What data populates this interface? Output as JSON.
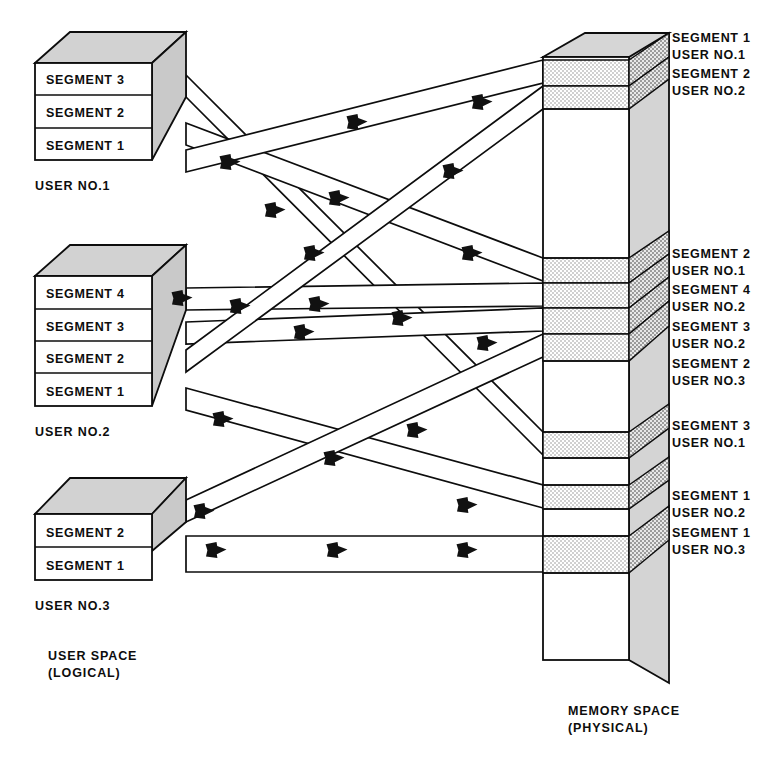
{
  "diagram": {
    "colors": {
      "ink": "#0d0d0d",
      "paper": "#ffffff",
      "box_top_fill": "#d2d2d2",
      "box_side_fill": "#c9c9c9",
      "memory_side_fill": "#cfcfcf",
      "memory_band_fill": "#e3e3e3",
      "arrow_fill": "#111111"
    },
    "left_caption": {
      "line1": "USER SPACE",
      "line2": "(LOGICAL)"
    },
    "right_caption": {
      "line1": "MEMORY SPACE",
      "line2": "(PHYSICAL)"
    },
    "users": [
      {
        "id": "user-1",
        "label": "USER NO.1",
        "segments": [
          {
            "label": "SEGMENT 3"
          },
          {
            "label": "SEGMENT 2"
          },
          {
            "label": "SEGMENT 1"
          }
        ]
      },
      {
        "id": "user-2",
        "label": "USER NO.2",
        "segments": [
          {
            "label": "SEGMENT 4"
          },
          {
            "label": "SEGMENT 3"
          },
          {
            "label": "SEGMENT 2"
          },
          {
            "label": "SEGMENT 1"
          }
        ]
      },
      {
        "id": "user-3",
        "label": "USER NO.3",
        "segments": [
          {
            "label": "SEGMENT 2"
          },
          {
            "label": "SEGMENT 1"
          }
        ]
      }
    ],
    "memory_labels": [
      {
        "id": "mem-label-1",
        "segment": "SEGMENT 1",
        "user": "USER NO.1"
      },
      {
        "id": "mem-label-2",
        "segment": "SEGMENT 2",
        "user": "USER NO.2"
      },
      {
        "id": "mem-label-3",
        "segment": "SEGMENT 2",
        "user": "USER NO.1"
      },
      {
        "id": "mem-label-4",
        "segment": "SEGMENT 4",
        "user": "USER NO.2"
      },
      {
        "id": "mem-label-5",
        "segment": "SEGMENT 3",
        "user": "USER NO.2"
      },
      {
        "id": "mem-label-6",
        "segment": "SEGMENT 2",
        "user": "USER NO.3"
      },
      {
        "id": "mem-label-7",
        "segment": "SEGMENT 3",
        "user": "USER NO.1"
      },
      {
        "id": "mem-label-8",
        "segment": "SEGMENT 1",
        "user": "USER NO.2"
      },
      {
        "id": "mem-label-9",
        "segment": "SEGMENT 1",
        "user": "USER NO.3"
      }
    ]
  }
}
